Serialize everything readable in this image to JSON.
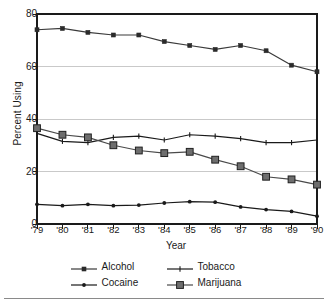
{
  "chart_data": {
    "type": "line",
    "title": "",
    "xlabel": "Year",
    "ylabel": "Percent Using",
    "categories": [
      "'79",
      "'80",
      "'81",
      "'82",
      "'83",
      "'84",
      "'85",
      "'86",
      "'87",
      "'88",
      "'89",
      "'90"
    ],
    "x": [
      1979,
      1980,
      1981,
      1982,
      1983,
      1984,
      1985,
      1986,
      1987,
      1988,
      1989,
      1990
    ],
    "ylim": [
      0,
      80
    ],
    "yticks": [
      0,
      20,
      40,
      60,
      80
    ],
    "ytick_labels": [
      "0",
      "20",
      "40",
      "60",
      "80"
    ],
    "grid": "horizontal",
    "legend_position": "bottom",
    "series": [
      {
        "name": "Alcohol",
        "marker": "small-square",
        "color": "#3a3a3a",
        "values": [
          74,
          74.5,
          73,
          72,
          72,
          69.5,
          68,
          66.5,
          68,
          66,
          60.5,
          58
        ]
      },
      {
        "name": "Tobacco",
        "marker": "tick",
        "color": "#1a1a1a",
        "values": [
          34.5,
          31.5,
          31,
          33,
          33.5,
          32,
          34,
          33.5,
          32.5,
          31,
          31,
          32
        ]
      },
      {
        "name": "Cocaine",
        "marker": "dot",
        "color": "#1a1a1a",
        "values": [
          7.5,
          7,
          7.5,
          7,
          7.2,
          8,
          8.5,
          8.3,
          6.5,
          5.5,
          4.8,
          3
        ]
      },
      {
        "name": "Marijuana",
        "marker": "large-square",
        "color": "#4a4a4a",
        "values": [
          36.5,
          34,
          33,
          30,
          28,
          27,
          27.5,
          24.5,
          22,
          18,
          17,
          15
        ]
      }
    ]
  },
  "legend": {
    "entries": [
      {
        "label": "Alcohol"
      },
      {
        "label": "Tobacco"
      },
      {
        "label": "Cocaine"
      },
      {
        "label": "Marijuana"
      }
    ]
  },
  "colors": {
    "axis": "#1a1a1a",
    "gridline": "#c9c9c9",
    "background": "#ffffff",
    "rule": "#8a8a8a"
  }
}
